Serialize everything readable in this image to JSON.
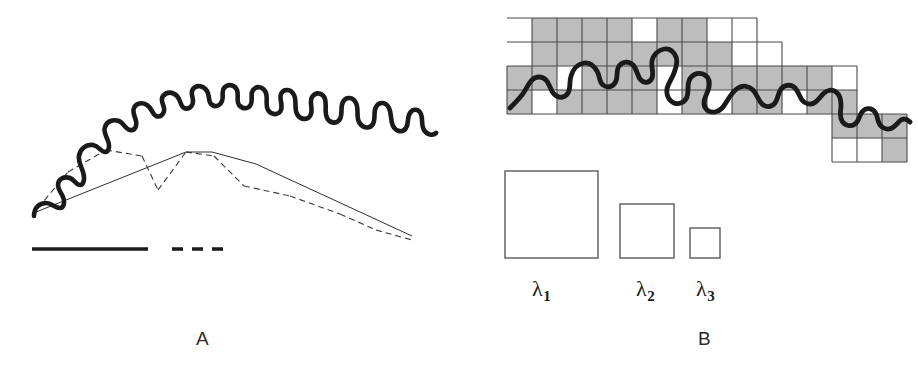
{
  "figure": {
    "kind": "two-panel scientific line drawing",
    "background_color": "#ffffff",
    "ink_color": "#1a1a1a",
    "grid_fill_color": "#bdbdbd",
    "grid_line_color": "#4a4a4a"
  },
  "panel_a": {
    "label": "A",
    "method_name": "divider-step method",
    "legend": [
      {
        "id": "delta1",
        "symbol": "δ",
        "subscript": "1",
        "line_style": "solid",
        "label": "δ1"
      },
      {
        "id": "delta2",
        "symbol": "δ",
        "subscript": "2",
        "line_style": "dashed",
        "label": "δ2"
      }
    ],
    "curve_description": "thick irregular self-similar coastline-like profile descending left to right",
    "chord_sets": {
      "delta1_chords": 3,
      "delta2_chords": 7
    }
  },
  "panel_b": {
    "label": "B",
    "method_name": "box-counting method",
    "grid": {
      "cell_width": 25,
      "cell_height": 24,
      "occupied_fill": "#bdbdbd",
      "empty_fill": "#ffffff"
    },
    "box_sizes": [
      {
        "id": "lambda1",
        "symbol": "λ",
        "subscript": "1",
        "label": "λ1",
        "side_px": 93
      },
      {
        "id": "lambda2",
        "symbol": "λ",
        "subscript": "2",
        "label": "λ2",
        "side_px": 54
      },
      {
        "id": "lambda3",
        "symbol": "λ",
        "subscript": "3",
        "label": "λ3",
        "side_px": 30
      }
    ],
    "curve_description": "thick irregular profile traversing a staircase of square grid cells; cells touched by the curve are shaded gray"
  }
}
